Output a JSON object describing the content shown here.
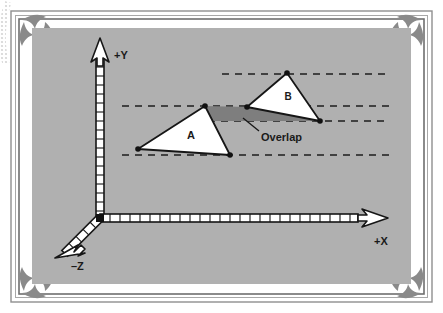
{
  "figure": {
    "background_color": "#ffffff",
    "plot_background_color": "#b0b0b0",
    "frame": {
      "outer_border_color": "#8d8d8d",
      "inner_border_color": "#6e6e6e",
      "ornament_color": "#9a9a9a"
    },
    "axes": {
      "origin_label": "origin",
      "x_axis_label": "+X",
      "y_axis_label": "+Y",
      "z_axis_label": "–Z",
      "axis_fill": "#ffffff",
      "axis_stroke": "#161616",
      "tick_count_x": 26,
      "tick_count_y": 17
    },
    "shapes": {
      "triangle_a": {
        "label": "A",
        "fill": "#ffffff",
        "stroke": "#161616",
        "vertices": [
          [
            205,
            106
          ],
          [
            138,
            149
          ],
          [
            230,
            155
          ]
        ]
      },
      "triangle_b": {
        "label": "B",
        "fill": "#ffffff",
        "stroke": "#161616",
        "vertices": [
          [
            287,
            73
          ],
          [
            247,
            107
          ],
          [
            320,
            121
          ]
        ]
      },
      "overlap": {
        "label": "Overlap",
        "fill": "#7e7e7e",
        "stroke": "none",
        "vertices": [
          [
            205,
            106
          ],
          [
            247,
            107
          ],
          [
            320,
            121
          ],
          [
            208,
            121
          ]
        ]
      }
    },
    "guides": {
      "dash_color": "#1c1c1c",
      "lines": [
        {
          "name": "guide-top",
          "y": 74,
          "x1": 222,
          "x2": 390
        },
        {
          "name": "guide-upper-mid",
          "y": 106,
          "x1": 122,
          "x2": 390
        },
        {
          "name": "guide-lower-mid",
          "y": 121,
          "x1": 208,
          "x2": 390
        },
        {
          "name": "guide-bottom",
          "y": 155,
          "x1": 122,
          "x2": 390
        }
      ]
    },
    "vertex_markers": {
      "color": "#111111",
      "radius": 2.6,
      "points": [
        [
          205,
          106
        ],
        [
          138,
          149
        ],
        [
          230,
          155
        ],
        [
          287,
          73
        ],
        [
          247,
          107
        ],
        [
          320,
          121
        ],
        [
          100,
          218
        ]
      ]
    },
    "callout": {
      "text": "Overlap",
      "text_x": 262,
      "text_y": 141,
      "leader": {
        "x1": 259,
        "y1": 131,
        "x2": 243,
        "y2": 119
      }
    }
  }
}
